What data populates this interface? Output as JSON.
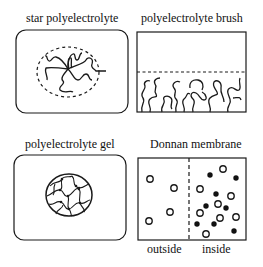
{
  "panels": {
    "star": {
      "title": "star polyelectrolyte"
    },
    "brush": {
      "title": "polyelectrolyte brush"
    },
    "gel": {
      "title": "polyelectrolyte gel"
    },
    "donnan": {
      "title": "Donnan membrane",
      "left_label": "outside",
      "right_label": "inside",
      "open_circles": [
        [
          150,
          179
        ],
        [
          174,
          188
        ],
        [
          170,
          212
        ],
        [
          149,
          221
        ],
        [
          223,
          169
        ],
        [
          200,
          189
        ],
        [
          231,
          196
        ],
        [
          218,
          204
        ],
        [
          200,
          213
        ],
        [
          220,
          218
        ],
        [
          236,
          217
        ],
        [
          206,
          234
        ]
      ],
      "filled_circles": [
        [
          210,
          175
        ],
        [
          236,
          178
        ],
        [
          216,
          194
        ],
        [
          206,
          206
        ],
        [
          226,
          208
        ],
        [
          197,
          224
        ],
        [
          214,
          224
        ],
        [
          234,
          231
        ]
      ]
    }
  },
  "colors": {
    "stroke": "#1a1a1a",
    "background": "#ffffff"
  }
}
